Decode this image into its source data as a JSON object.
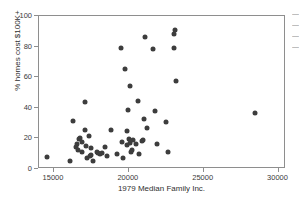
{
  "chart_data": {
    "type": "scatter",
    "title": "",
    "xlabel": "1979 Median Family Inc.",
    "ylabel": "% homes cost $100K+",
    "xlim": [
      14000,
      30500
    ],
    "ylim": [
      0,
      100
    ],
    "xticks": [
      15000,
      20000,
      25000,
      30000
    ],
    "xticklabels": [
      "15000",
      "20000",
      "25000",
      "30000"
    ],
    "yticks": [
      0,
      20,
      40,
      60,
      80,
      100
    ],
    "yticklabels": [
      "0",
      "20",
      "40",
      "60",
      "80",
      "100"
    ],
    "grid": false,
    "legend": null,
    "marker": "circle",
    "marker_color": "#3d3d3d",
    "marker_size": 5,
    "series": [
      {
        "name": "metro areas",
        "points": [
          [
            14550,
            7.6
          ],
          [
            16100,
            5.0
          ],
          [
            16300,
            31.6
          ],
          [
            16500,
            14.5
          ],
          [
            16550,
            16.2
          ],
          [
            16600,
            12.4
          ],
          [
            16700,
            19.3
          ],
          [
            16750,
            20.4
          ],
          [
            16850,
            10.8
          ],
          [
            16900,
            17.6
          ],
          [
            17050,
            44.0
          ],
          [
            17100,
            25.6
          ],
          [
            17150,
            15.0
          ],
          [
            17200,
            7.2
          ],
          [
            17350,
            21.4
          ],
          [
            17400,
            8.8
          ],
          [
            17450,
            13.4
          ],
          [
            17500,
            9.0
          ],
          [
            17600,
            5.2
          ],
          [
            17900,
            11.2
          ],
          [
            17950,
            10.6
          ],
          [
            18050,
            9.8
          ],
          [
            18200,
            10.2
          ],
          [
            18400,
            14.4
          ],
          [
            18550,
            8.2
          ],
          [
            18800,
            25.2
          ],
          [
            19200,
            9.6
          ],
          [
            19450,
            79.3
          ],
          [
            19550,
            17.8
          ],
          [
            19600,
            7.0
          ],
          [
            19750,
            65.3
          ],
          [
            19850,
            24.8
          ],
          [
            19900,
            16.0
          ],
          [
            19950,
            38.7
          ],
          [
            20000,
            19.8
          ],
          [
            20050,
            17.2
          ],
          [
            20100,
            54.0
          ],
          [
            20150,
            11.4
          ],
          [
            20200,
            12.6
          ],
          [
            20250,
            19.0
          ],
          [
            20500,
            16.4
          ],
          [
            20600,
            44.6
          ],
          [
            20700,
            10.0
          ],
          [
            20900,
            18.0
          ],
          [
            20950,
            18.8
          ],
          [
            21000,
            33.0
          ],
          [
            21100,
            86.6
          ],
          [
            21200,
            27.0
          ],
          [
            21600,
            78.4
          ],
          [
            21750,
            38.2
          ],
          [
            21900,
            16.2
          ],
          [
            22500,
            30.8
          ],
          [
            22600,
            11.4
          ],
          [
            23000,
            88.4
          ],
          [
            23050,
            78.8
          ],
          [
            23100,
            90.8
          ],
          [
            23150,
            57.6
          ],
          [
            28400,
            36.8
          ]
        ]
      }
    ]
  },
  "edge_fragment": {
    "lines": [
      "—",
      "—",
      "—",
      "—"
    ]
  }
}
